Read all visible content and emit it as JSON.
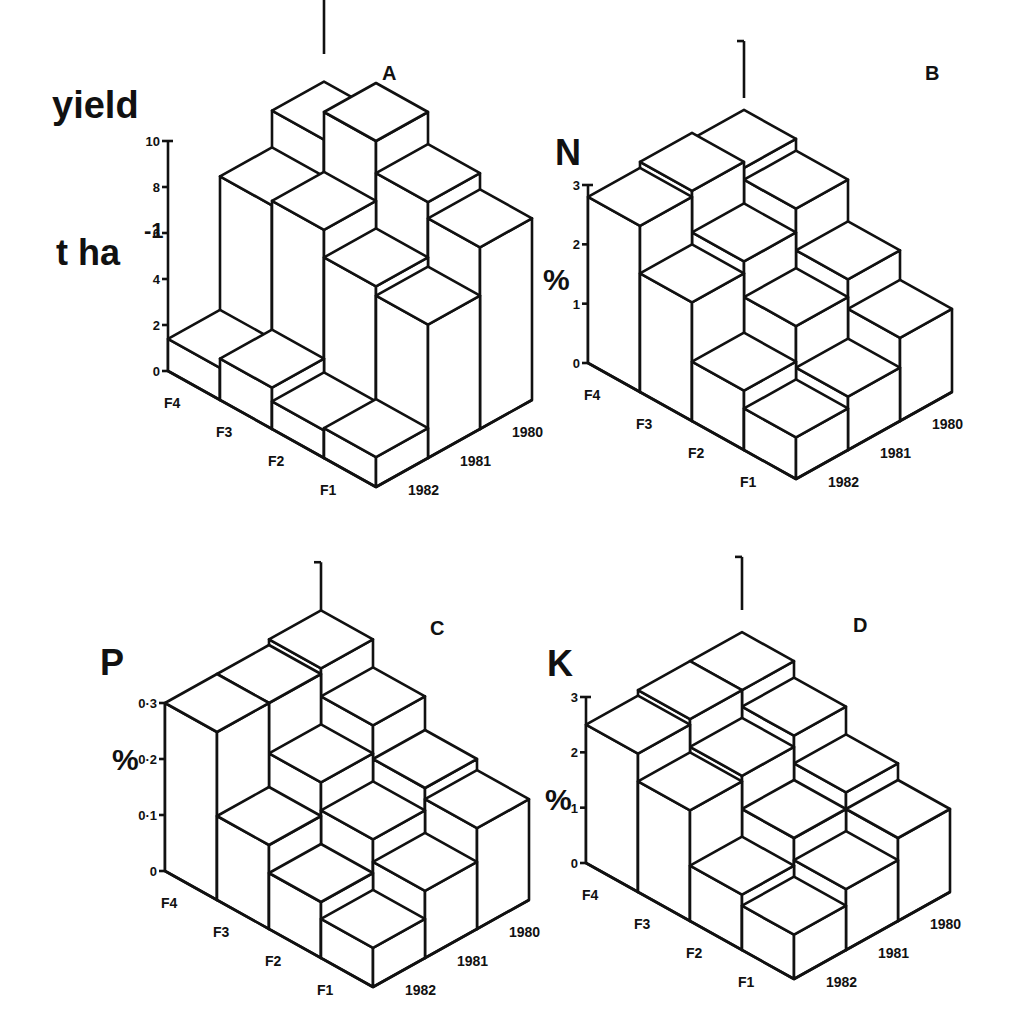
{
  "figure": {
    "panels": [
      {
        "id": "A",
        "letter": "A",
        "nutrient": "yield",
        "unit_line1": "yield",
        "unit_line2": "t ha",
        "unit_sup": "-1"
      },
      {
        "id": "B",
        "letter": "B",
        "nutrient": "N",
        "unit": "%"
      },
      {
        "id": "C",
        "letter": "C",
        "nutrient": "P",
        "unit": "%"
      },
      {
        "id": "D",
        "letter": "D",
        "nutrient": "K",
        "unit": "%"
      }
    ]
  },
  "chart_data": [
    {
      "type": "bar",
      "subtype": "3d-bar",
      "title": "A",
      "ylabel": "yield t ha-1",
      "ylim": [
        0,
        10
      ],
      "yticks": [
        "0",
        "2",
        "4",
        "6",
        "8",
        "10"
      ],
      "x_categories": [
        "F4",
        "F3",
        "F2",
        "F1"
      ],
      "depth_categories": [
        "1982",
        "1981",
        "1980"
      ],
      "series": [
        {
          "name": "1982",
          "values": [
            1.4,
            1.8,
            1.2,
            1.3
          ]
        },
        {
          "name": "1981",
          "values": [
            7.2,
            7.4,
            6.2,
            5.8
          ]
        },
        {
          "name": "1980",
          "values": [
            8.8,
            10.0,
            8.6,
            7.9
          ]
        }
      ]
    },
    {
      "type": "bar",
      "subtype": "3d-bar",
      "title": "B",
      "ylabel": "N %",
      "ylim": [
        0,
        3
      ],
      "yticks": [
        "0",
        "1",
        "2",
        "3"
      ],
      "x_categories": [
        "F4",
        "F3",
        "F2",
        "F1"
      ],
      "depth_categories": [
        "1982",
        "1981",
        "1980"
      ],
      "series": [
        {
          "name": "1982",
          "values": [
            2.8,
            2.0,
            1.0,
            0.7
          ]
        },
        {
          "name": "1981",
          "values": [
            2.9,
            2.2,
            1.6,
            0.9
          ]
        },
        {
          "name": "1980",
          "values": [
            2.8,
            2.6,
            1.9,
            1.4
          ]
        }
      ]
    },
    {
      "type": "bar",
      "subtype": "3d-bar",
      "title": "C",
      "ylabel": "P %",
      "ylim": [
        0,
        0.3
      ],
      "yticks": [
        "0",
        "0·1",
        "0·2",
        "0·3"
      ],
      "x_categories": [
        "F4",
        "F3",
        "F2",
        "F1"
      ],
      "depth_categories": [
        "1982",
        "1981",
        "1980"
      ],
      "series": [
        {
          "name": "1982",
          "values": [
            0.3,
            0.15,
            0.1,
            0.07
          ]
        },
        {
          "name": "1981",
          "values": [
            0.3,
            0.21,
            0.16,
            0.12
          ]
        },
        {
          "name": "1980",
          "values": [
            0.31,
            0.26,
            0.2,
            0.18
          ]
        }
      ]
    },
    {
      "type": "bar",
      "subtype": "3d-bar",
      "title": "D",
      "ylabel": "K %",
      "ylim": [
        0,
        3
      ],
      "yticks": [
        "0",
        "1",
        "2",
        "3"
      ],
      "x_categories": [
        "F4",
        "F3",
        "F2",
        "F1"
      ],
      "depth_categories": [
        "1982",
        "1981",
        "1980"
      ],
      "series": [
        {
          "name": "1982",
          "values": [
            2.5,
            2.0,
            1.0,
            0.8
          ]
        },
        {
          "name": "1981",
          "values": [
            2.6,
            2.1,
            1.5,
            1.1
          ]
        },
        {
          "name": "1980",
          "values": [
            2.6,
            2.3,
            1.8,
            1.5
          ]
        }
      ]
    }
  ]
}
